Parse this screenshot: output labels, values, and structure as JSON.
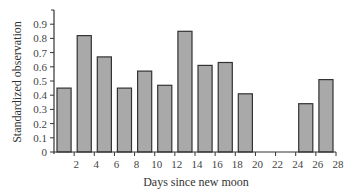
{
  "chart_data": {
    "type": "bar",
    "title": "",
    "xlabel": "Days since new moon",
    "ylabel": "Standardized observation",
    "xlim": [
      0,
      28
    ],
    "ylim": [
      0,
      1.0
    ],
    "x_ticks": [
      2,
      4,
      6,
      8,
      10,
      12,
      14,
      16,
      18,
      20,
      22,
      24,
      26,
      28
    ],
    "y_ticks": [
      0,
      0.1,
      0.2,
      0.3,
      0.4,
      0.5,
      0.6,
      0.7,
      0.8,
      0.9
    ],
    "grid": false,
    "legend": null,
    "bars": [
      {
        "x_start": 0,
        "x_end": 2,
        "value": 0.45
      },
      {
        "x_start": 2,
        "x_end": 4,
        "value": 0.82
      },
      {
        "x_start": 4,
        "x_end": 6,
        "value": 0.67
      },
      {
        "x_start": 6,
        "x_end": 8,
        "value": 0.45
      },
      {
        "x_start": 8,
        "x_end": 10,
        "value": 0.57
      },
      {
        "x_start": 10,
        "x_end": 12,
        "value": 0.47
      },
      {
        "x_start": 12,
        "x_end": 14,
        "value": 0.85
      },
      {
        "x_start": 14,
        "x_end": 16,
        "value": 0.61
      },
      {
        "x_start": 16,
        "x_end": 18,
        "value": 0.63
      },
      {
        "x_start": 18,
        "x_end": 20,
        "value": 0.41
      },
      {
        "x_start": 20,
        "x_end": 22,
        "value": 0
      },
      {
        "x_start": 22,
        "x_end": 24,
        "value": 0
      },
      {
        "x_start": 24,
        "x_end": 26,
        "value": 0.34
      },
      {
        "x_start": 26,
        "x_end": 28,
        "value": 0.51
      }
    ],
    "categories": [
      "0-2",
      "2-4",
      "4-6",
      "6-8",
      "8-10",
      "10-12",
      "12-14",
      "14-16",
      "16-18",
      "18-20",
      "20-22",
      "22-24",
      "24-26",
      "26-28"
    ],
    "values": [
      0.45,
      0.82,
      0.67,
      0.45,
      0.57,
      0.47,
      0.85,
      0.61,
      0.63,
      0.41,
      0,
      0,
      0.34,
      0.51
    ],
    "colors": {
      "bar_fill": "#a9a9a9",
      "bar_stroke": "#333333",
      "axis": "#333333"
    }
  }
}
